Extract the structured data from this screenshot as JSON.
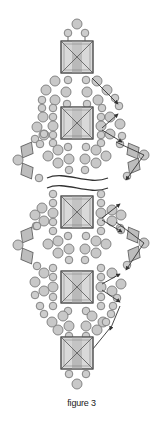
{
  "figure": {
    "caption": "figure 3",
    "colors": {
      "bead_fill": "#c8c8c8",
      "bead_stroke": "#7a7a7a",
      "square_fill": "#d6d6d6",
      "square_stripe": "#bcbcbc",
      "square_stroke": "#5a5a5a",
      "thread": "#333333",
      "break_line": "#333333"
    },
    "legend_elements": [
      {
        "type": "square-bead",
        "count": 5
      },
      {
        "type": "round-bead-large"
      },
      {
        "type": "round-bead-small"
      },
      {
        "type": "bicone-bead"
      },
      {
        "type": "thread-path-arrow"
      },
      {
        "type": "break-mark"
      }
    ]
  }
}
